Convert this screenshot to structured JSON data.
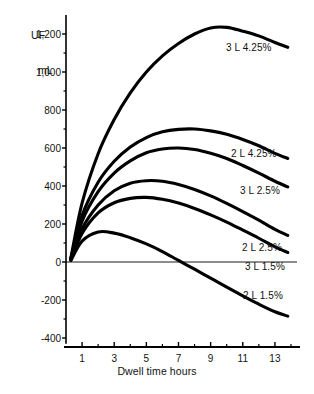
{
  "chart_data": {
    "type": "line",
    "title": "",
    "xlabel": "Dwell time hours",
    "ylabel": "UF\nmL",
    "ylabel_line1": "UF",
    "ylabel_line2": "mL",
    "xlim": [
      0,
      14
    ],
    "ylim": [
      -400,
      1300
    ],
    "grid": false,
    "legend_position": "inline-right-of-curves",
    "yticks": [
      -400,
      -200,
      0,
      200,
      400,
      600,
      800,
      1000,
      1200
    ],
    "ytick_labels": [
      "-400",
      "-200",
      "0",
      "200",
      "400",
      "600",
      "800",
      "1,000",
      "1,200"
    ],
    "xticks": [
      1,
      3,
      5,
      7,
      9,
      11,
      13
    ],
    "xtick_labels": [
      "1",
      "3",
      "5",
      "7",
      "9",
      "11",
      "13"
    ],
    "xminor_ticks": [
      2,
      4,
      6,
      8,
      10,
      12,
      14
    ],
    "yminor_ticks": [
      -300,
      -100,
      100,
      300,
      500,
      700,
      900,
      1100
    ],
    "zero_line": 0,
    "x": [
      0.3,
      1,
      2,
      3,
      4,
      5,
      6,
      7,
      8,
      9,
      10,
      11,
      12,
      13,
      13.8
    ],
    "series": [
      {
        "name": "3 L 4.25%",
        "label": "3 L 4.25%",
        "color": "#000000",
        "peak_hour": 9.2,
        "peak_value": 1235,
        "values": [
          20,
          310,
          570,
          750,
          890,
          1000,
          1085,
          1150,
          1200,
          1232,
          1235,
          1215,
          1190,
          1155,
          1130
        ]
      },
      {
        "name": "2 L 4.25%",
        "label": "2 L 4.25%",
        "color": "#000000",
        "peak_hour": 7.6,
        "peak_value": 700,
        "values": [
          18,
          245,
          420,
          530,
          605,
          655,
          685,
          698,
          700,
          690,
          672,
          645,
          612,
          572,
          545
        ]
      },
      {
        "name": "3 L 2.5%",
        "label": "3 L 2.5%",
        "color": "#000000",
        "peak_hour": 7.0,
        "peak_value": 600,
        "values": [
          15,
          215,
          370,
          468,
          532,
          575,
          595,
          600,
          592,
          572,
          545,
          508,
          468,
          425,
          395
        ]
      },
      {
        "name": "2 L 2.5%",
        "label": "2 L 2.5%",
        "color": "#000000",
        "peak_hour": 5.6,
        "peak_value": 430,
        "values": [
          12,
          175,
          300,
          375,
          415,
          428,
          425,
          408,
          382,
          348,
          308,
          265,
          220,
          172,
          140
        ]
      },
      {
        "name": "3 L 1.5%",
        "label": "3 L 1.5%",
        "color": "#000000",
        "peak_hour": 4.8,
        "peak_value": 340,
        "values": [
          10,
          150,
          258,
          312,
          335,
          340,
          330,
          310,
          282,
          248,
          210,
          168,
          125,
          80,
          50
        ]
      },
      {
        "name": "2 L 1.5%",
        "label": "2 L 1.5%",
        "color": "#000000",
        "peak_hour": 2.2,
        "peak_value": 160,
        "zero_crossing_hour": 7.1,
        "values": [
          8,
          110,
          158,
          152,
          128,
          95,
          55,
          8,
          -38,
          -85,
          -132,
          -178,
          -222,
          -262,
          -285
        ]
      }
    ],
    "series_label_positions": [
      {
        "label": "3 L 4.25%",
        "x": 226,
        "y": 42
      },
      {
        "label": "2 L 4.25%",
        "x": 231,
        "y": 148
      },
      {
        "label": "3 L 2.5%",
        "x": 240,
        "y": 185
      },
      {
        "label": "2 L 2.5%",
        "x": 242,
        "y": 242
      },
      {
        "label": "3 L 1.5%",
        "x": 245,
        "y": 261
      },
      {
        "label": "2 L 1.5%",
        "x": 243,
        "y": 290
      }
    ]
  }
}
